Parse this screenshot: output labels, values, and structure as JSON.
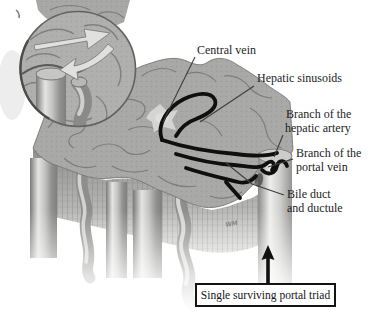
{
  "figure": {
    "labels": {
      "central_vein": "Central vein",
      "hepatic_sinusoids": "Hepatic sinusoids",
      "hepatic_artery": [
        "Branch of the",
        "hepatic artery"
      ],
      "portal_vein": [
        "Branch of the",
        "portal vein"
      ],
      "bile_duct": [
        "Bile duct",
        "and ductule"
      ],
      "caption": "Single surviving portal triad",
      "signature": "WM"
    },
    "icons": {
      "up_arrow": "arrow-up-icon",
      "magnifier_inset": "magnifier-circle"
    },
    "colors": {
      "ink": "#1a1a1a",
      "label_text": "#1d1d1d",
      "tissue_base": "#a9a9a7",
      "tissue_line": "#767674",
      "sinusoid_highlight": "#0f0f0f",
      "background": "#ffffff"
    }
  }
}
